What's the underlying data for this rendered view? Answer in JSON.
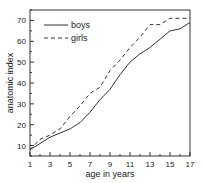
{
  "chart_data": {
    "type": "line",
    "title": "",
    "xlabel": "age in years",
    "ylabel": "anatomic index",
    "xlim": [
      1,
      17
    ],
    "ylim": [
      5,
      75
    ],
    "x_ticks": [
      1,
      3,
      5,
      7,
      9,
      11,
      13,
      15,
      17
    ],
    "y_ticks": [
      10,
      20,
      30,
      40,
      50,
      60,
      70
    ],
    "grid": false,
    "legend_position": "upper left",
    "x": [
      1,
      2,
      3,
      4,
      5,
      6,
      7,
      8,
      9,
      10,
      11,
      12,
      13,
      14,
      15,
      16,
      17
    ],
    "series": [
      {
        "name": "boys",
        "style": "solid",
        "values": [
          8,
          11,
          14,
          16,
          18,
          21,
          26,
          32,
          37,
          44,
          50,
          54,
          57,
          61,
          65,
          66,
          69
        ]
      },
      {
        "name": "girls",
        "style": "dashed",
        "values": [
          8,
          13,
          15,
          18,
          24,
          29,
          35,
          38,
          46,
          51,
          57,
          62,
          68,
          68,
          71,
          71,
          71
        ]
      }
    ]
  }
}
